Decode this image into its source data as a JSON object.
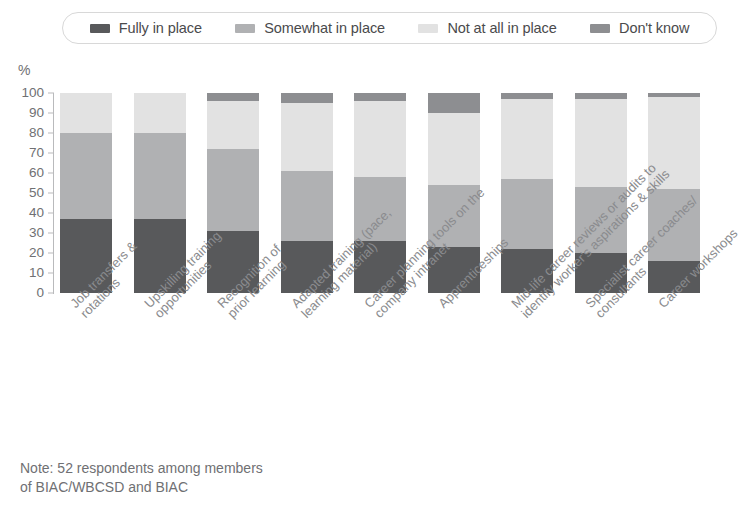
{
  "legend": {
    "items": [
      {
        "label": "Fully in place",
        "color": "#58595b",
        "icon": "legend-swatch-icon"
      },
      {
        "label": "Somewhat in place",
        "color": "#b0b1b3",
        "icon": "legend-swatch-icon"
      },
      {
        "label": "Not at all in place",
        "color": "#e2e2e2",
        "icon": "legend-swatch-icon"
      },
      {
        "label": "Don't know",
        "color": "#8d8e91",
        "icon": "legend-swatch-icon"
      }
    ]
  },
  "axis": {
    "unit": "%",
    "yticks": [
      "100",
      "90",
      "80",
      "70",
      "60",
      "50",
      "40",
      "30",
      "20",
      "10",
      "0"
    ]
  },
  "note": {
    "line1": "Note: 52 respondents among members",
    "line2": "of BIAC/WBCSD and BIAC"
  },
  "chart_data": {
    "type": "bar",
    "stacked": true,
    "stack_total": 100,
    "title": "",
    "xlabel": "",
    "ylabel": "%",
    "ylim": [
      0,
      100
    ],
    "ytick_step": 10,
    "grid": false,
    "legend_position": "top",
    "categories": [
      "Job transfers &\nrotations",
      "Upskilling training\nopportunities",
      "Recognition of\nprior learning",
      "Adapted training (pace,\nlearning material)",
      "Career planning tools on the\ncompany intranet",
      "Apprenticeships",
      "Mid-life career reviews or audits to\nidentify worker's aspirations & skills",
      "Specialist career coaches/\nconsultants",
      "Career workshops"
    ],
    "series": [
      {
        "name": "Fully in place",
        "color": "#58595b",
        "values": [
          37,
          37,
          31,
          26,
          26,
          23,
          22,
          20,
          16
        ]
      },
      {
        "name": "Somewhat in place",
        "color": "#b0b1b3",
        "values": [
          43,
          43,
          41,
          35,
          32,
          31,
          35,
          33,
          36
        ]
      },
      {
        "name": "Not at all in place",
        "color": "#e2e2e2",
        "values": [
          20,
          20,
          24,
          34,
          38,
          36,
          40,
          44,
          46
        ]
      },
      {
        "name": "Don't know",
        "color": "#8d8e91",
        "values": [
          0,
          0,
          4,
          5,
          4,
          10,
          3,
          3,
          2
        ]
      }
    ]
  }
}
